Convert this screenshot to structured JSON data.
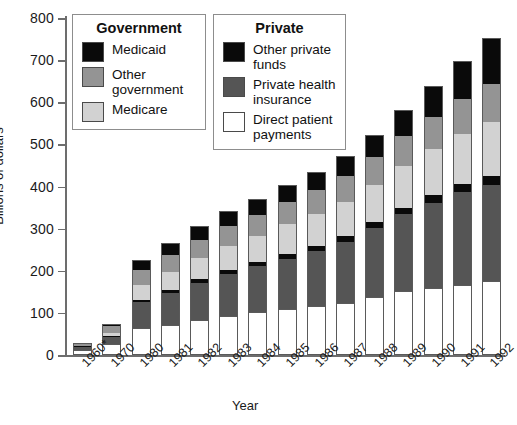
{
  "chart_data": {
    "type": "bar",
    "subtype": "stacked-vertical",
    "title": "",
    "xlabel": "Year",
    "ylabel": "Billions of dollars",
    "ylim": [
      0,
      800
    ],
    "yticks": [
      0,
      100,
      200,
      300,
      400,
      500,
      600,
      700,
      800
    ],
    "grid": false,
    "legend_position": "top-inside",
    "categories": [
      "1960*",
      "1970",
      "1980",
      "1981",
      "1982",
      "1983",
      "1984",
      "1985",
      "1986",
      "1987",
      "1988",
      "1989",
      "1990",
      "1991",
      "1992"
    ],
    "series": [
      {
        "name": "Direct patient payments",
        "group": "Private",
        "color": "#ffffff",
        "values": [
          13,
          26,
          63,
          72,
          83,
          92,
          101,
          110,
          116,
          123,
          137,
          151,
          159,
          167,
          175
        ]
      },
      {
        "name": "Private health insurance",
        "group": "Private",
        "color": "#555555",
        "values": [
          6,
          16,
          62,
          76,
          89,
          101,
          110,
          119,
          131,
          146,
          164,
          183,
          203,
          220,
          228
        ]
      },
      {
        "name": "Other private funds",
        "group": "Private",
        "color": "#0a0a0a",
        "values": [
          2,
          3,
          6,
          7,
          8,
          9,
          10,
          11,
          12,
          13,
          14,
          15,
          17,
          19,
          21
        ]
      },
      {
        "name": "Medicare",
        "group": "Government",
        "color": "#d2d2d2",
        "values": [
          0,
          7,
          36,
          43,
          51,
          57,
          62,
          71,
          75,
          81,
          88,
          99,
          109,
          118,
          129
        ]
      },
      {
        "name": "Other government",
        "group": "Government",
        "color": "#949494",
        "values": [
          5,
          16,
          34,
          39,
          43,
          47,
          50,
          53,
          57,
          61,
          66,
          72,
          78,
          84,
          90
        ]
      },
      {
        "name": "Medicaid",
        "group": "Government",
        "color": "#0a0a0a",
        "values": [
          1,
          5,
          25,
          29,
          32,
          35,
          37,
          40,
          44,
          49,
          54,
          61,
          72,
          91,
          109
        ]
      }
    ],
    "totals": [
      27,
      73,
      226,
      266,
      306,
      341,
      370,
      404,
      435,
      473,
      523,
      581,
      638,
      699,
      752
    ]
  },
  "axis": {
    "y_title": "Billions of dollars",
    "x_title": "Year",
    "y_tick_labels": [
      "800",
      "700",
      "600",
      "500",
      "400",
      "300",
      "200",
      "100",
      "0"
    ],
    "x_tick_labels": [
      "1960*",
      "1970",
      "1980",
      "1981",
      "1982",
      "1983",
      "1984",
      "1985",
      "1986",
      "1987",
      "1988",
      "1989",
      "1990",
      "1991",
      "1992"
    ]
  },
  "legends": [
    {
      "id": "government",
      "title": "Government",
      "entries": [
        {
          "label": "Medicaid",
          "color": "#0a0a0a"
        },
        {
          "label": "Other\ngovernment",
          "color": "#949494"
        },
        {
          "label": "Medicare",
          "color": "#d2d2d2"
        }
      ]
    },
    {
      "id": "private",
      "title": "Private",
      "entries": [
        {
          "label": "Other private\nfunds",
          "color": "#0a0a0a"
        },
        {
          "label": "Private health\ninsurance",
          "color": "#555555"
        },
        {
          "label": "Direct patient\npayments",
          "color": "#ffffff"
        }
      ]
    }
  ],
  "colors": {
    "medicaid": "#0a0a0a",
    "other_government": "#949494",
    "medicare": "#d2d2d2",
    "other_private_funds": "#0a0a0a",
    "private_health_insurance": "#555555",
    "direct_patient_payments": "#ffffff",
    "axis": "#6d6d6d",
    "outline": "#5a5a5a"
  }
}
